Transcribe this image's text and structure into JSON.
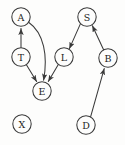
{
  "diagram": {
    "type": "directed-graph",
    "title": "",
    "width": 125,
    "height": 145,
    "colors": {
      "background": "#fdfdfc",
      "stroke": "#3a3a3a",
      "label": "#1d1d1d",
      "node_fill": "#fdfdfc"
    },
    "node_radius": 9.2,
    "nodes": [
      {
        "id": "A",
        "label": "A",
        "cx": 21,
        "cy": 17
      },
      {
        "id": "S",
        "label": "S",
        "cx": 87,
        "cy": 17
      },
      {
        "id": "T",
        "label": "T",
        "cx": 21,
        "cy": 57
      },
      {
        "id": "L",
        "label": "L",
        "cx": 64,
        "cy": 57
      },
      {
        "id": "B",
        "label": "B",
        "cx": 108,
        "cy": 58
      },
      {
        "id": "E",
        "label": "E",
        "cx": 42,
        "cy": 91
      },
      {
        "id": "X",
        "label": "X",
        "cx": 22,
        "cy": 124
      },
      {
        "id": "D",
        "label": "D",
        "cx": 86,
        "cy": 125
      }
    ],
    "edges": [
      {
        "from": "T",
        "to": "A",
        "shape": "straight"
      },
      {
        "from": "A",
        "to": "E",
        "shape": "curved"
      },
      {
        "from": "T",
        "to": "E",
        "shape": "straight"
      },
      {
        "from": "L",
        "to": "E",
        "shape": "straight"
      },
      {
        "from": "S",
        "to": "L",
        "shape": "straight"
      },
      {
        "from": "B",
        "to": "S",
        "shape": "straight"
      },
      {
        "from": "D",
        "to": "B",
        "shape": "straight"
      }
    ],
    "isolated_nodes": [
      "X"
    ]
  }
}
